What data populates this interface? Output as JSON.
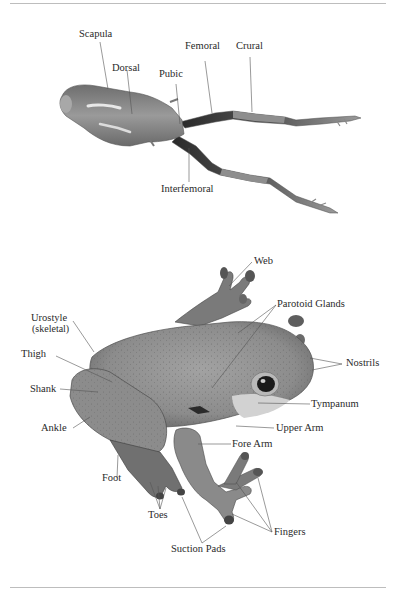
{
  "diagram": {
    "top_figure": {
      "subject": "frog skeletal/dorsal view (stretched)",
      "labels": [
        {
          "id": "scapula",
          "text": "Scapula"
        },
        {
          "id": "dorsal",
          "text": "Dorsal"
        },
        {
          "id": "pubic",
          "text": "Pubic"
        },
        {
          "id": "femoral",
          "text": "Femoral"
        },
        {
          "id": "crural",
          "text": "Crural"
        },
        {
          "id": "interfemoral",
          "text": "Interfemoral"
        }
      ]
    },
    "bottom_figure": {
      "subject": "tree frog side view",
      "labels": [
        {
          "id": "web",
          "text": "Web"
        },
        {
          "id": "parotoid",
          "text": "Parotoid Glands"
        },
        {
          "id": "urostyle",
          "text": "Urostyle"
        },
        {
          "id": "urostyle_sub",
          "text": "(skeletal)"
        },
        {
          "id": "thigh",
          "text": "Thigh"
        },
        {
          "id": "nostrils",
          "text": "Nostrils"
        },
        {
          "id": "shank",
          "text": "Shank"
        },
        {
          "id": "tympanum",
          "text": "Tympanum"
        },
        {
          "id": "ankle",
          "text": "Ankle"
        },
        {
          "id": "upper_arm",
          "text": "Upper Arm"
        },
        {
          "id": "fore_arm",
          "text": "Fore Arm"
        },
        {
          "id": "foot",
          "text": "Foot"
        },
        {
          "id": "toes",
          "text": "Toes"
        },
        {
          "id": "fingers",
          "text": "Fingers"
        },
        {
          "id": "suction_pads",
          "text": "Suction Pads"
        }
      ]
    },
    "colors": {
      "rule": "#bdbdbd",
      "label_text": "#2a2a2a",
      "leader_line": "#555555",
      "frog_skin": "#8a8a8a",
      "frog_dark": "#3a3a3a"
    }
  }
}
